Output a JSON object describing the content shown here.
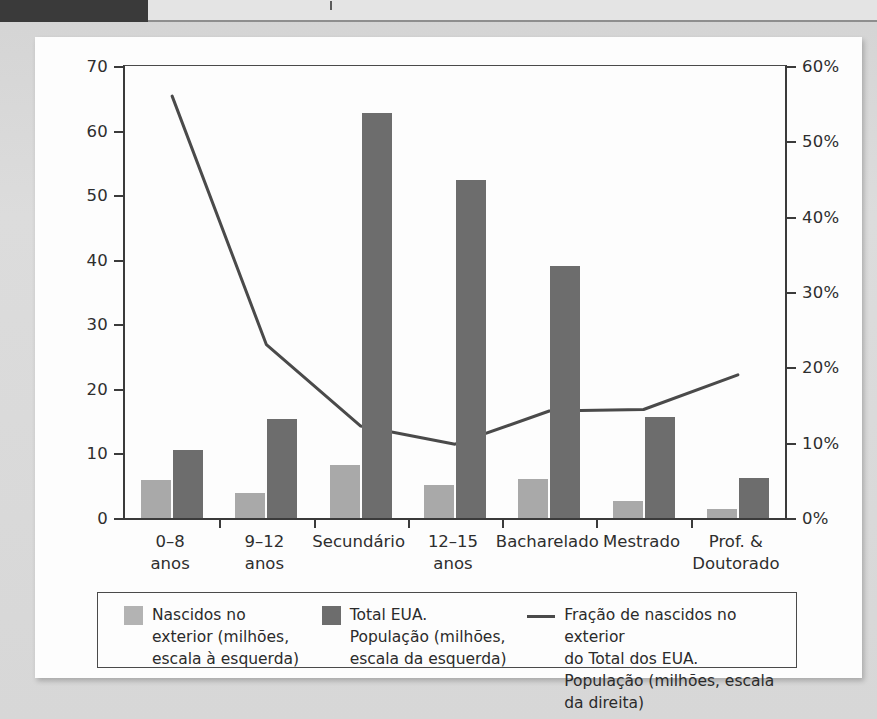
{
  "page": {
    "background_color": "#d9d9d9",
    "card_color": "#fdfdfd"
  },
  "colors": {
    "bar_light": "#a9a9a9",
    "bar_dark": "#6d6d6d",
    "line": "#4a4a4a",
    "axis": "#3b3b3b"
  },
  "chart_data": {
    "type": "bar",
    "title": "",
    "xlabel": "",
    "ylabel": "",
    "categories": [
      "0–8\nanos",
      "9–12\nanos",
      "Secundário",
      "12–15\nanos",
      "Bacharelado",
      "Mestrado",
      "Prof. &\nDoutorado"
    ],
    "series": [
      {
        "name": "Nascidos no exterior (milhões, escala à esquerda)",
        "type": "bar",
        "axis": "left",
        "color": "#a9a9a9",
        "values": [
          5.9,
          3.8,
          8.2,
          5.1,
          6.0,
          2.6,
          1.4
        ]
      },
      {
        "name": "Total EUA. População (milhões, escala da esquerda)",
        "type": "bar",
        "axis": "left",
        "color": "#6d6d6d",
        "values": [
          10.6,
          15.4,
          62.7,
          52.3,
          39.1,
          15.6,
          6.2
        ]
      },
      {
        "name": "Fração de nascidos no exterior do Total dos EUA. População (milhões, escala da direita)",
        "type": "line",
        "axis": "right",
        "color": "#4a4a4a",
        "values": [
          56,
          23,
          12.2,
          9.8,
          14.2,
          14.4,
          19
        ]
      }
    ],
    "y_left": {
      "ticks": [
        0,
        10,
        20,
        30,
        40,
        50,
        60,
        70
      ],
      "tick_labels": [
        "0",
        "10",
        "20",
        "30",
        "40",
        "50",
        "60",
        "70"
      ],
      "lim": [
        0,
        70
      ],
      "unit": "milhões"
    },
    "y_right": {
      "ticks": [
        0,
        10,
        20,
        30,
        40,
        50,
        60
      ],
      "tick_labels": [
        "0%",
        "10%",
        "20%",
        "30%",
        "40%",
        "50%",
        "60%"
      ],
      "lim": [
        0,
        60
      ],
      "unit": "%"
    },
    "grid": false,
    "legend_position": "bottom"
  },
  "legend": {
    "items": [
      {
        "marker": "light-swatch",
        "label": "Nascidos no\nexterior (milhões,\nescala à esquerda)"
      },
      {
        "marker": "dark-swatch",
        "label": "Total EUA.\nPopulação (milhões,\nescala da esquerda)"
      },
      {
        "marker": "line-sample",
        "label": "Fração de nascidos no exterior\ndo Total dos EUA.\nPopulação (milhões, escala da direita)"
      }
    ]
  }
}
